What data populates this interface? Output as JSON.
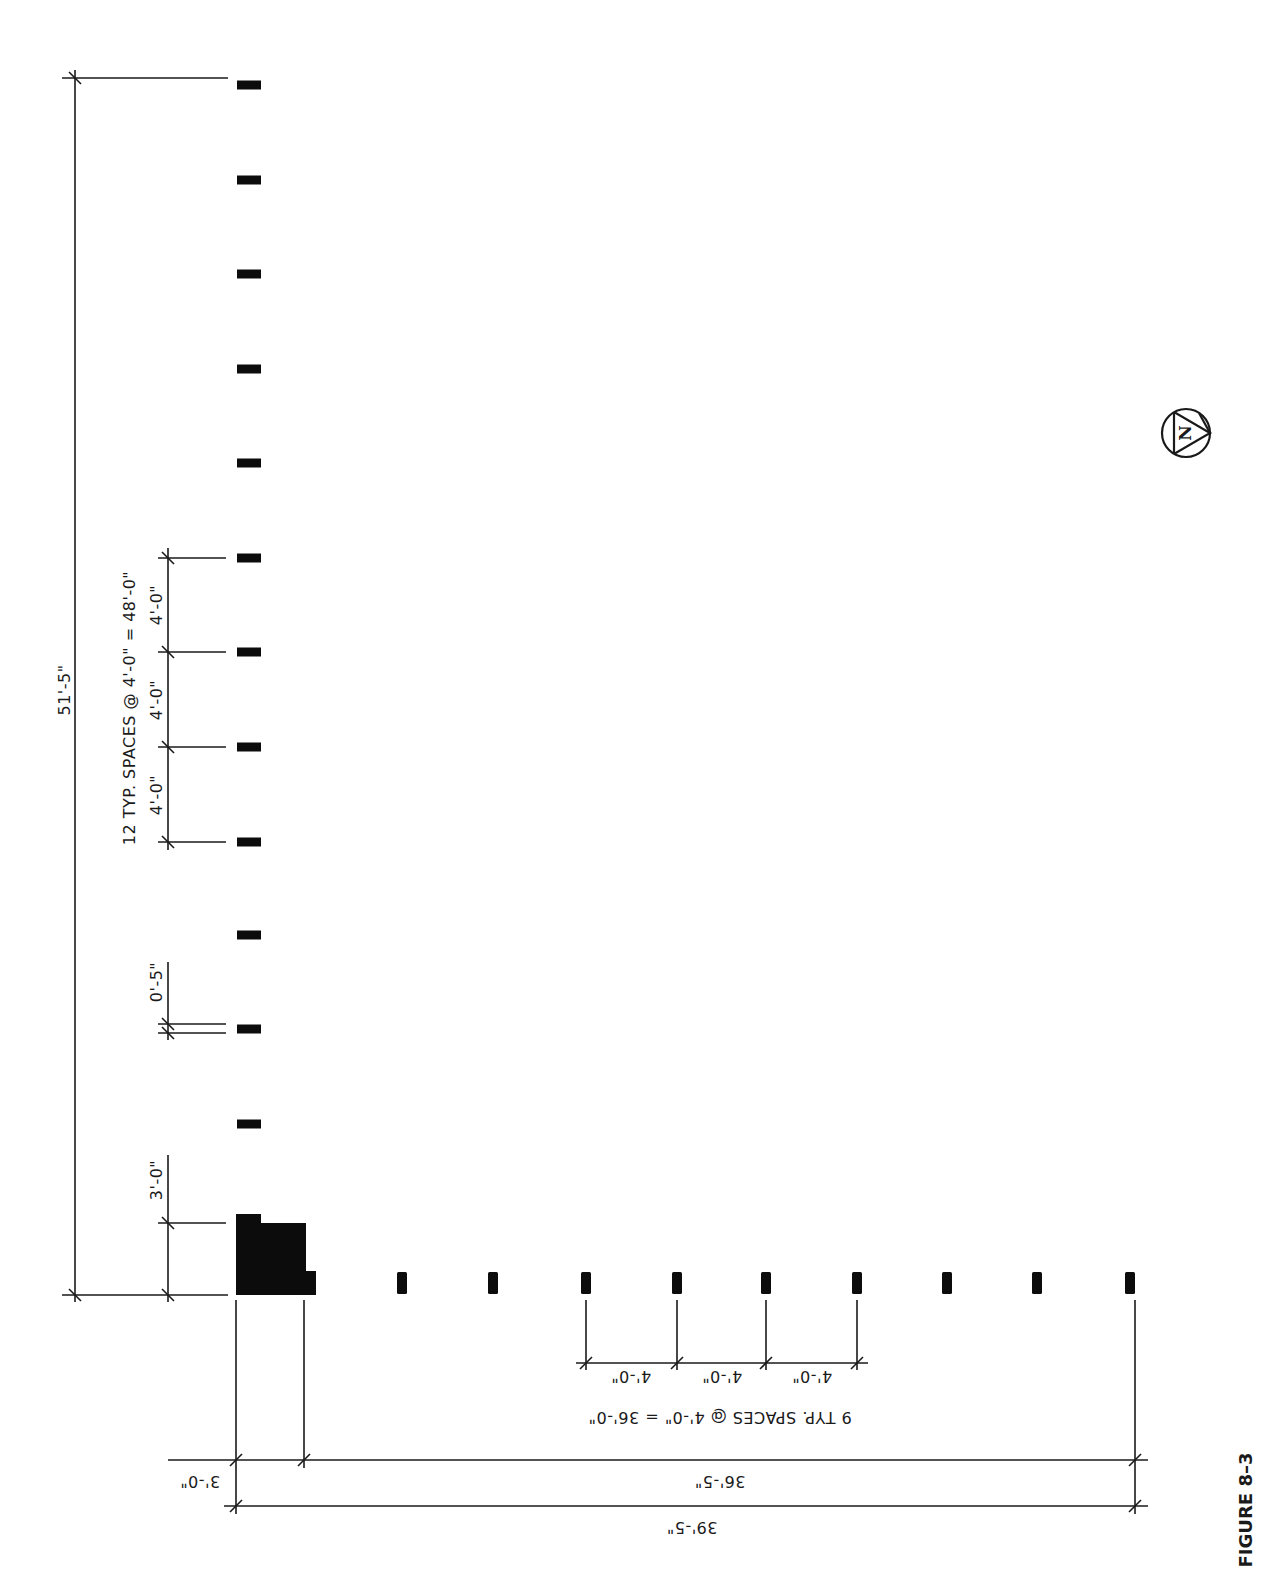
{
  "figure": {
    "label": "FIGURE 8–3"
  },
  "north_arrow": {
    "letter": "N",
    "cx": 1186,
    "cy": 433,
    "r": 24
  },
  "colors": {
    "ink": "#1a1a1a",
    "post_fill": "#0c0c0c",
    "background": "#ffffff"
  },
  "vertical_row": {
    "post_x": 237,
    "post_w": 24,
    "post_h": 9,
    "post_centers_y": [
      85,
      180,
      274,
      369,
      463,
      558,
      652,
      747,
      842,
      935,
      1029,
      1124
    ]
  },
  "horizontal_row": {
    "post_y": 1272,
    "post_h": 22,
    "post_w": 10,
    "post_centers_x": [
      402,
      493,
      586,
      677,
      766,
      857,
      947,
      1037,
      1130
    ]
  },
  "corner_block": {
    "description": "corner post cluster",
    "polygon": "236,1214 261,1214 261,1223 306,1223 306,1271 316,1271 316,1295 236,1295"
  },
  "dimensions": {
    "overall_vertical": {
      "label": "51'-5\"",
      "x": 75,
      "y1": 78,
      "y2": 1295
    },
    "typ_spaces_vertical": {
      "label": "12 TYP. SPACES @ 4'-0\" = 48'-0\""
    },
    "vertical_chain": {
      "x": 168,
      "ticks_y": [
        558,
        652,
        747,
        842
      ],
      "labels": [
        "4'-0\"",
        "4'-0\"",
        "4'-0\""
      ]
    },
    "small_gap": {
      "label": "0'-5\"",
      "x": 168,
      "y1": 1024,
      "y2": 1033
    },
    "corner_vertical": {
      "label": "3'-0\"",
      "x": 168,
      "y1": 1223,
      "y2": 1295
    },
    "horizontal_chain": {
      "y": 1363,
      "ticks_x": [
        586,
        677,
        766,
        857
      ],
      "labels": [
        "4'-0\"",
        "4'-0\"",
        "4'-0\""
      ]
    },
    "typ_spaces_horizontal": {
      "label": "9 TYP. SPACES @ 4'-0\" = 36'-0\""
    },
    "dim_36_5": {
      "label": "36'-5\"",
      "y": 1460,
      "x1": 304,
      "x2": 1135
    },
    "dim_3_0_bottom": {
      "label": "3'-0\"",
      "y": 1460,
      "x1": 236,
      "x2": 304
    },
    "overall_horizontal": {
      "label": "39'-5\"",
      "y": 1506,
      "x1": 236,
      "x2": 1135
    }
  }
}
